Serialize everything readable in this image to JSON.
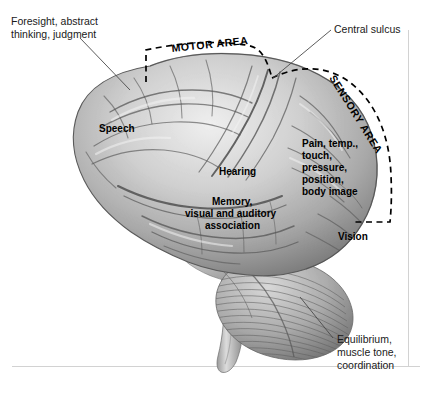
{
  "figure": {
    "background_color": "#ffffff",
    "frame_color": "#d2d2d2",
    "ink_color": "#1a1a1a",
    "brain_tone_light": "#f0f0f0",
    "brain_tone_mid": "#b8b8b8",
    "brain_tone_dark": "#6e6e6e"
  },
  "callouts": {
    "foresight": {
      "lines": [
        "Foresight, abstract",
        "thinking, judgment"
      ],
      "style": "thin",
      "position": "top-left"
    },
    "central_sulcus": {
      "lines": [
        "Central sulcus"
      ],
      "style": "thin",
      "position": "top-right"
    },
    "equilibrium": {
      "lines": [
        "Equilibrium,",
        "muscle tone,",
        "coordination"
      ],
      "style": "thin",
      "position": "bottom-right"
    }
  },
  "area_labels": {
    "motor": "MOTOR AREA",
    "sensory": "SENSORY AREA"
  },
  "region_labels": {
    "speech": {
      "lines": [
        "Speech"
      ]
    },
    "hearing": {
      "lines": [
        "Hearing"
      ]
    },
    "memory": {
      "lines": [
        "Memory,",
        "visual and auditory",
        "association"
      ]
    },
    "somatosensory": {
      "lines": [
        "Pain, temp.,",
        "touch,",
        "pressure,",
        "position,",
        "body image"
      ]
    },
    "vision": {
      "lines": [
        "Vision"
      ]
    }
  }
}
